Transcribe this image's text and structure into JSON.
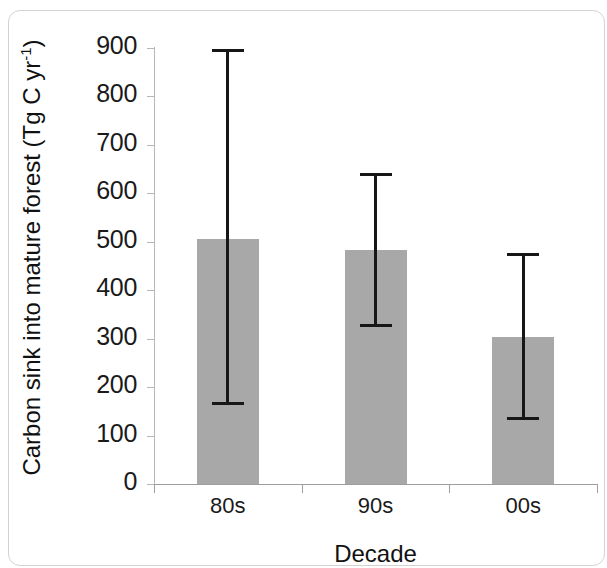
{
  "chart_data": {
    "type": "bar",
    "title": "",
    "xlabel": "Decade",
    "ylabel": "Carbon sink into mature forest (Tg C yr",
    "ylabel_sup": "-1",
    "ylabel_tail": ")",
    "categories": [
      "80s",
      "90s",
      "00s"
    ],
    "values": [
      505,
      483,
      303
    ],
    "error_low": [
      167,
      328,
      137
    ],
    "error_high": [
      895,
      640,
      475
    ],
    "yticks": [
      0,
      100,
      200,
      300,
      400,
      500,
      600,
      700,
      800,
      900
    ],
    "ytick_labels": [
      "0",
      "100",
      "200",
      "300",
      "400",
      "500",
      "600",
      "700",
      "800",
      "900"
    ],
    "ylim": [
      0,
      900
    ],
    "grid": false,
    "legend": "none",
    "bar_color": "#a8a8a8",
    "error_color": "#171717",
    "axis_color": "#9e9e9e"
  }
}
